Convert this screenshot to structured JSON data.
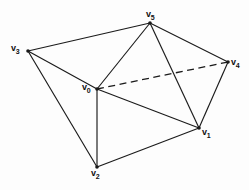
{
  "figure": {
    "background_color": "#fdfdfd",
    "edge_color": "#1a1a1a",
    "label_color": "#111111",
    "width": 249,
    "height": 190
  },
  "chart_data": {
    "type": "diagram",
    "title": "",
    "vertices": [
      {
        "id": "v0",
        "base": "v",
        "sub": "0",
        "x": 97,
        "y": 89,
        "label_x": 82,
        "label_y": 83
      },
      {
        "id": "v1",
        "base": "v",
        "sub": "1",
        "x": 199,
        "y": 128,
        "label_x": 202,
        "label_y": 128
      },
      {
        "id": "v2",
        "base": "v",
        "sub": "2",
        "x": 97,
        "y": 167,
        "label_x": 91,
        "label_y": 169
      },
      {
        "id": "v3",
        "base": "v",
        "sub": "3",
        "x": 28,
        "y": 51,
        "label_x": 11,
        "label_y": 44
      },
      {
        "id": "v4",
        "base": "v",
        "sub": "4",
        "x": 228,
        "y": 62,
        "label_x": 231,
        "label_y": 58
      },
      {
        "id": "v5",
        "base": "v",
        "sub": "5",
        "x": 150,
        "y": 23,
        "label_x": 146,
        "label_y": 10
      }
    ],
    "edges": [
      {
        "from": "v3",
        "to": "v5",
        "style": "solid"
      },
      {
        "from": "v3",
        "to": "v0",
        "style": "solid"
      },
      {
        "from": "v3",
        "to": "v2",
        "style": "solid"
      },
      {
        "from": "v5",
        "to": "v0",
        "style": "solid"
      },
      {
        "from": "v5",
        "to": "v1",
        "style": "solid"
      },
      {
        "from": "v5",
        "to": "v4",
        "style": "solid"
      },
      {
        "from": "v0",
        "to": "v2",
        "style": "solid"
      },
      {
        "from": "v0",
        "to": "v1",
        "style": "solid"
      },
      {
        "from": "v2",
        "to": "v1",
        "style": "solid"
      },
      {
        "from": "v1",
        "to": "v4",
        "style": "solid"
      },
      {
        "from": "v0",
        "to": "v4",
        "style": "dashed"
      }
    ],
    "legend": [],
    "xlabel": "",
    "ylabel": ""
  }
}
